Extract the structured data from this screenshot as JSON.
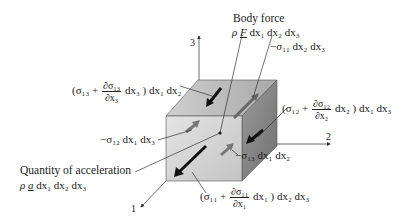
{
  "diagram": {
    "axes": {
      "axis_1_label": "1",
      "axis_2_label": "2",
      "axis_3_label": "3"
    },
    "labels": {
      "body_force_title": "Body force",
      "body_force_expr": "ρ F dx₁ dx₂ dx₃",
      "body_force_rho": "ρ",
      "body_force_vec": "F",
      "body_force_rest": "dx₁ dx₂ dx₃",
      "sigma11_neg": "−σ₁₁ dx₂ dx₃",
      "sigma13_pos_open": "(σ₁₃ +",
      "sigma13_pos_num": "∂σ₁₃",
      "sigma13_pos_den": "∂x₃",
      "sigma13_pos_close": "dx₃ ) dx₁ dx₂",
      "sigma12_pos_open": "(σ₁₂ +",
      "sigma12_pos_num": "∂σ₁₂",
      "sigma12_pos_den": "∂x₂",
      "sigma12_pos_close": "dx₂ ) dx₁ dx₃",
      "sigma12_neg": "−σ₁₂ dx₁ dx₃",
      "sigma13_neg": "−σ₁₃ dx₁ dx₂",
      "sigma11_pos_open": "(σ₁₁ +",
      "sigma11_pos_num": "∂σ₁₁",
      "sigma11_pos_den": "∂x₁",
      "sigma11_pos_close": "dx₁ ) dx₂ dx₃",
      "acceleration_title": "Quantity of acceleration",
      "acceleration_rho": "ρ",
      "acceleration_vec": "a",
      "acceleration_rest": "dx₁ dx₂ dx₃"
    },
    "colors": {
      "front_face": "#d4d4d4",
      "top_face": "#bdbdbd",
      "right_face": "#8a8a8a",
      "arrow_dark": "#111111",
      "arrow_gray": "#6e6e6e",
      "line": "#333333"
    }
  }
}
